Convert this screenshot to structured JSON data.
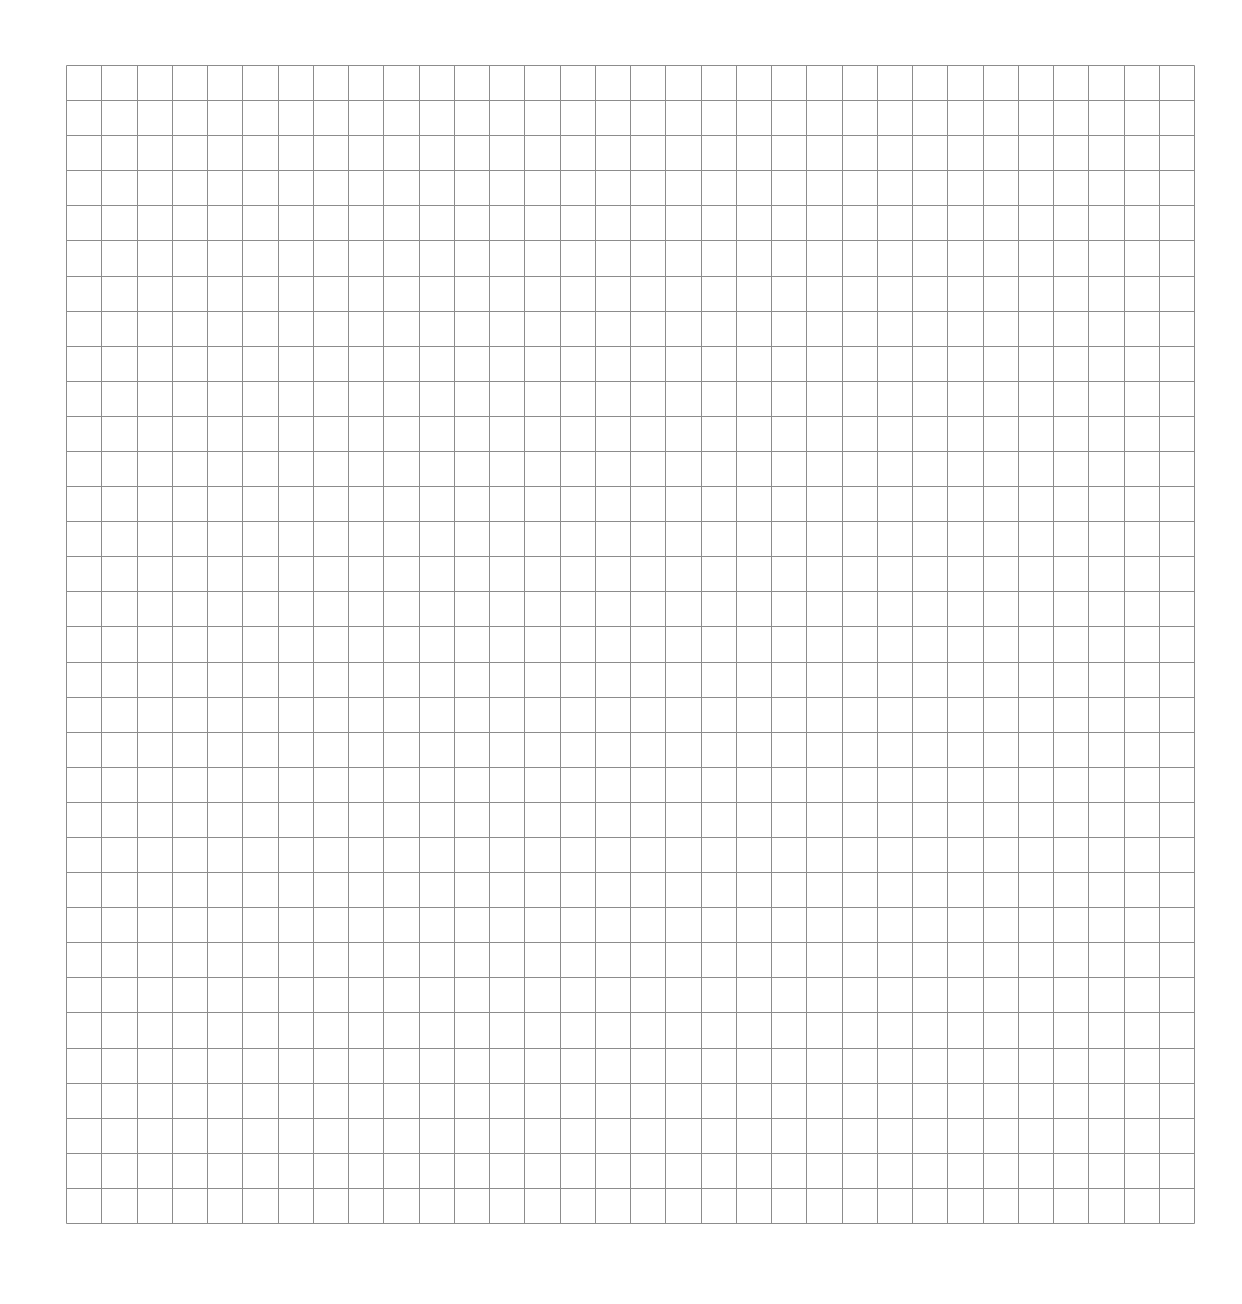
{
  "page": {
    "background": "#ffffff",
    "width": 1242,
    "height": 1304
  },
  "grid": {
    "left": 66,
    "top": 65,
    "width": 1128,
    "height": 1158,
    "columns": 32,
    "rows": 33,
    "line_color": "#8c8c8c",
    "line_width": 1
  }
}
